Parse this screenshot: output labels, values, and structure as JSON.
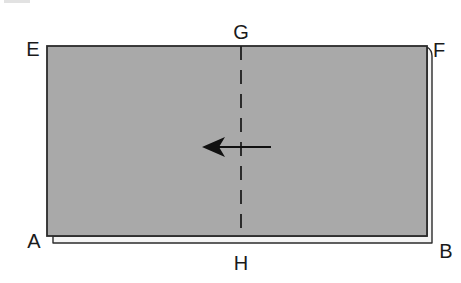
{
  "diagram": {
    "colors": {
      "sheet_fill": "#a9a9a9",
      "sheet_stroke": "#2b2b2b",
      "back_sheet_fill": "#f4f4f4",
      "fold_line": "#1e1e1e",
      "arrow": "#111111",
      "label": "#1a1a1a"
    },
    "labels": {
      "top_left": "E",
      "top_right": "F",
      "top_center": "G",
      "bottom_left": "A",
      "bottom_center": "H",
      "bottom_right": "B"
    },
    "fold_line": {
      "style": "dashed",
      "from": "G",
      "to": "H"
    },
    "arrow": {
      "direction": "left"
    }
  }
}
